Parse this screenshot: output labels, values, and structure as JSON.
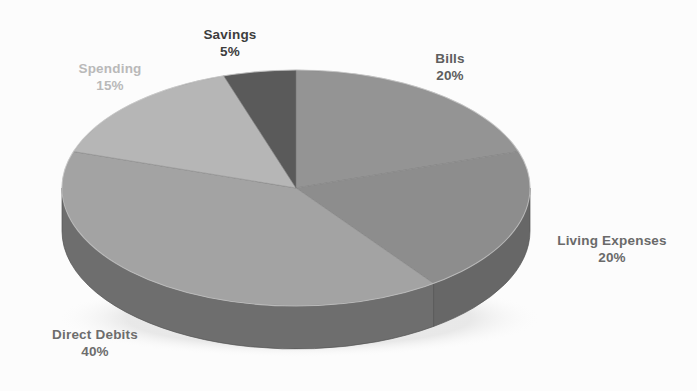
{
  "chart_data": {
    "type": "pie",
    "title": "",
    "subtitle": "",
    "xlabel": "",
    "ylabel": "",
    "legend_position": "none",
    "grid": false,
    "three_d": true,
    "start_angle_deg": 0,
    "direction": "clockwise",
    "categories": [
      "Bills",
      "Living Expenses",
      "Direct Debits",
      "Spending",
      "Savings"
    ],
    "values": [
      20,
      20,
      40,
      15,
      5
    ],
    "value_unit": "%",
    "slices": [
      {
        "label": "Bills",
        "value": 20,
        "value_text": "20%",
        "color": "#949494",
        "side_color": "#6f6f6f",
        "label_color": "#5e5e5e"
      },
      {
        "label": "Living Expenses",
        "value": 20,
        "value_text": "20%",
        "color": "#8d8d8d",
        "side_color": "#676767",
        "label_color": "#6a6a6a"
      },
      {
        "label": "Direct Debits",
        "value": 40,
        "value_text": "40%",
        "color": "#a3a3a3",
        "side_color": "#6e6e6e",
        "label_color": "#6d6d6d"
      },
      {
        "label": "Spending",
        "value": 15,
        "value_text": "15%",
        "color": "#b6b6b6",
        "side_color": "#868686",
        "label_color": "#b9b9b9"
      },
      {
        "label": "Savings",
        "value": 5,
        "value_text": "5%",
        "color": "#5a5a5a",
        "side_color": "#4a4a4a",
        "label_color": "#3d3d3d"
      }
    ]
  },
  "labels": {
    "savings": {
      "name": "Savings",
      "value": "5%"
    },
    "spending": {
      "name": "Spending",
      "value": "15%"
    },
    "bills": {
      "name": "Bills",
      "value": "20%"
    },
    "living": {
      "name": "Living Expenses",
      "value": "20%"
    },
    "direct_debits": {
      "name": "Direct Debits",
      "value": "40%"
    }
  },
  "colors": {
    "background": "#fcfcfc",
    "savings": "#5a5a5a",
    "bills": "#949494",
    "living_expenses": "#8d8d8d",
    "direct_debits": "#a3a3a3",
    "spending": "#b6b6b6",
    "side_wall": "#6e6e6e"
  }
}
